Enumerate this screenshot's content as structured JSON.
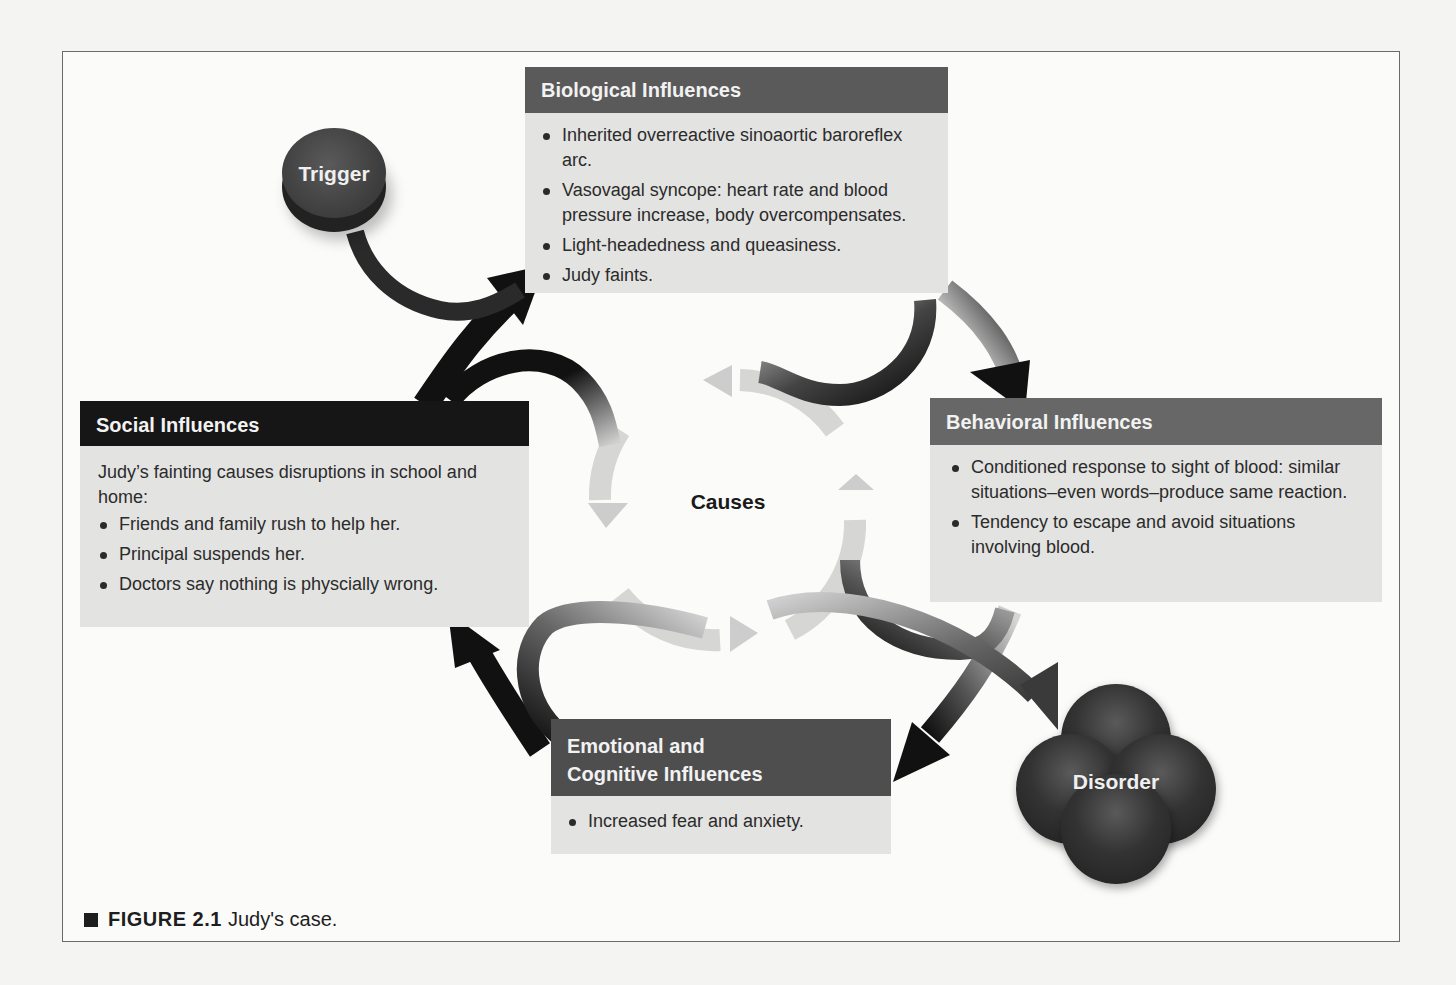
{
  "figure": {
    "caption_label": "FIGURE 2.1",
    "caption_text": "Judy's case."
  },
  "nodes": {
    "trigger": {
      "label": "Trigger"
    },
    "disorder": {
      "label": "Disorder"
    },
    "center": {
      "label": "Causes"
    }
  },
  "boxes": {
    "biological": {
      "title": "Biological Influences",
      "items": [
        "Inherited overreactive sinoaortic baroreflex arc.",
        "Vasovagal syncope: heart rate and blood pressure increase, body overcompensates.",
        "Light-headedness and queasiness.",
        "Judy faints."
      ]
    },
    "social": {
      "title": "Social Influences",
      "intro": "Judy’s fainting causes disruptions in school and home:",
      "items": [
        "Friends and family rush to help her.",
        "Principal suspends her.",
        "Doctors say nothing is physcially wrong."
      ]
    },
    "behavioral": {
      "title": "Behavioral Influences",
      "items": [
        "Conditioned response to sight of blood: similar situations–even words–produce same reaction.",
        "Tendency to escape and avoid situations involving blood."
      ]
    },
    "emotional": {
      "title_line1": "Emotional and",
      "title_line2": "Cognitive Influences",
      "items": [
        "Increased fear and anxiety."
      ]
    }
  },
  "colors": {
    "biological_header": "#5a5a5a",
    "social_header": "#161616",
    "behavioral_header": "#676767",
    "emotional_header": "#4e4e4e",
    "box_body": "#e3e3e1",
    "arrow_dark": "#111111",
    "arrow_light": "#cfcfcf"
  }
}
